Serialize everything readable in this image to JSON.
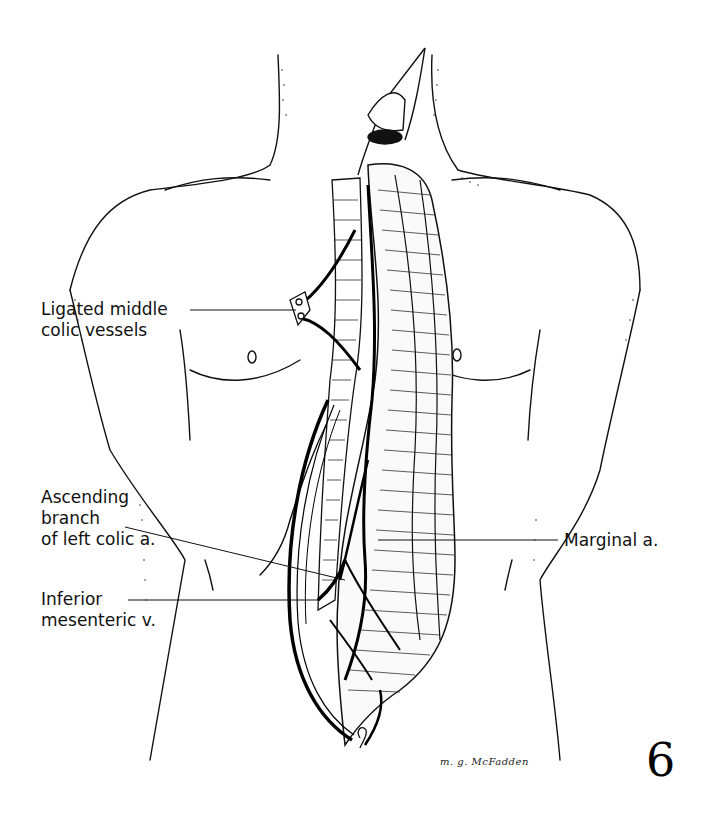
{
  "figure": {
    "number": "6",
    "signature": "m. g. McFadden",
    "colors": {
      "ink": "#111111",
      "background": "#ffffff"
    }
  },
  "labels": [
    {
      "id": "ligated-middle-colic-vessels",
      "lines": [
        "Ligated middle",
        "colic vessels"
      ]
    },
    {
      "id": "ascending-branch-left-colic",
      "lines": [
        "Ascending",
        "branch",
        "of left colic a."
      ]
    },
    {
      "id": "inferior-mesenteric-vein",
      "lines": [
        "Inferior",
        "mesenteric v."
      ]
    },
    {
      "id": "marginal-artery",
      "lines": [
        "Marginal a."
      ]
    }
  ]
}
